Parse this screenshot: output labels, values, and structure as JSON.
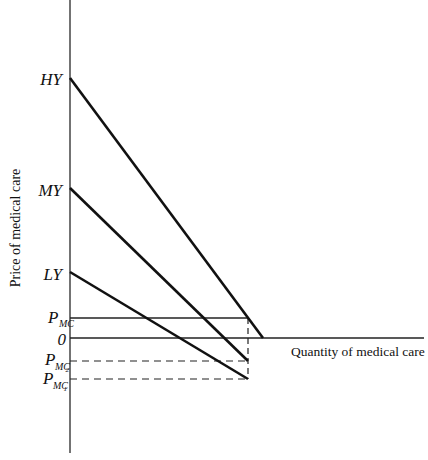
{
  "diagram": {
    "title": "",
    "y_axis_label": "Price of medical care",
    "x_axis_label": "Quantity of medical care",
    "y_labels": {
      "hy": "HY",
      "my": "MY",
      "ly": "LY",
      "pmc": "P",
      "pmc_sub": "MC",
      "zero": "0",
      "pmc2": "P",
      "pmc2_sub": "MC",
      "pmc2_num": "2",
      "pmc1": "P",
      "pmc1_sub": "MC",
      "pmc1_num": "1"
    },
    "lines": [
      {
        "name": "HY",
        "from": [
          70,
          78
        ],
        "to": [
          263,
          338
        ]
      },
      {
        "name": "MY",
        "from": [
          70,
          188
        ],
        "to": [
          248,
          361
        ]
      },
      {
        "name": "LY",
        "from": [
          70,
          272
        ],
        "to": [
          248,
          379
        ]
      }
    ],
    "price_levels": {
      "pmc": 318,
      "zero": 338,
      "pmc2": 361,
      "pmc1": 379
    },
    "quantity_mark_x": 248,
    "line_color": "#111111",
    "axis_color": "#333333"
  }
}
